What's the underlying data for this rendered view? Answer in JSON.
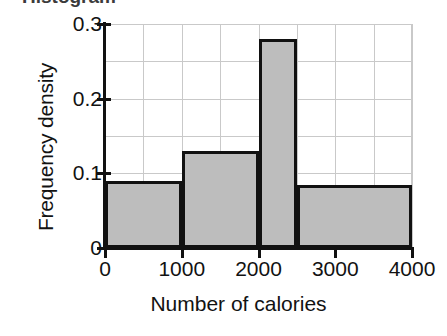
{
  "chart_data": {
    "type": "bar",
    "title": "",
    "xlabel": "Number of calories",
    "ylabel": "Frequency density",
    "xlim": [
      0,
      4000
    ],
    "ylim": [
      0,
      0.3
    ],
    "grid": true,
    "legend": "none",
    "x_major_ticks": [
      "0",
      "1000",
      "2000",
      "3000",
      "4000"
    ],
    "x_major_tick_values": [
      0,
      1000,
      2000,
      3000,
      4000
    ],
    "y_major_ticks": [
      "0",
      "0.1",
      "0.2",
      "0.3"
    ],
    "y_major_tick_values": [
      0,
      0.1,
      0.2,
      0.3
    ],
    "x_minor_tick_step": 500,
    "y_minor_tick_step": 0.05,
    "bar_fill_color": "#bdbdbd",
    "bar_edge_color": "#111111",
    "grid_color": "#c9c9c9",
    "axis_color": "#111111",
    "bins": [
      {
        "label": "0-1000",
        "x_start": 0,
        "x_end": 1000,
        "width": 1000,
        "frequency_density": 0.09,
        "frequency": 90
      },
      {
        "label": "1000-2000",
        "x_start": 1000,
        "x_end": 2000,
        "width": 1000,
        "frequency_density": 0.13,
        "frequency": 130
      },
      {
        "label": "2000-2500",
        "x_start": 2000,
        "x_end": 2500,
        "width": 500,
        "frequency_density": 0.28,
        "frequency": 140
      },
      {
        "label": "2500-4000",
        "x_start": 2500,
        "x_end": 4000,
        "width": 1500,
        "frequency_density": 0.085,
        "frequency": 127.5
      }
    ],
    "categories": [
      "0-1000",
      "1000-2000",
      "2000-2500",
      "2500-4000"
    ],
    "values": [
      0.09,
      0.13,
      0.28,
      0.085
    ]
  },
  "figure": {
    "clipped_caption_hint": "Histogram"
  }
}
